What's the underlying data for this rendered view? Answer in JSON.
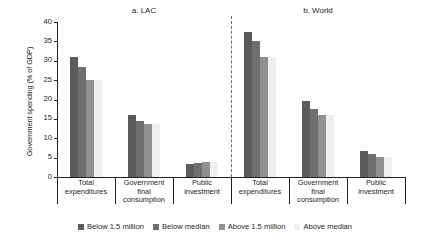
{
  "chart_data": {
    "type": "bar",
    "title": "",
    "xlabel": "",
    "ylabel": "Government spending (% of GDP)",
    "ylim": [
      0,
      40
    ],
    "yticks": [
      0,
      5,
      10,
      15,
      20,
      25,
      30,
      35,
      40
    ],
    "ytick_labels": [
      "0",
      "5",
      "10",
      "15",
      "20",
      "25",
      "30",
      "35",
      "40"
    ],
    "grid": false,
    "legend_position": "bottom",
    "panels": [
      {
        "title": "a. LAC",
        "categories": [
          "Total expenditures",
          "Government final consumption",
          "Public investment"
        ],
        "series": [
          {
            "name": "Below 1.5 million",
            "values": [
              31.0,
              16.0,
              3.3
            ]
          },
          {
            "name": "Below median",
            "values": [
              28.5,
              14.5,
              3.5
            ]
          },
          {
            "name": "Above 1.5 million",
            "values": [
              25.0,
              13.7,
              3.8
            ]
          },
          {
            "name": "Above median",
            "values": [
              25.0,
              13.7,
              3.8
            ]
          }
        ]
      },
      {
        "title": "b. World",
        "categories": [
          "Total expenditures",
          "Government final consumption",
          "Public investment"
        ],
        "series": [
          {
            "name": "Below 1.5 million",
            "values": [
              37.5,
              19.5,
              6.6
            ]
          },
          {
            "name": "Below median",
            "values": [
              35.0,
              17.6,
              6.0
            ]
          },
          {
            "name": "Above 1.5 million",
            "values": [
              31.0,
              16.0,
              5.2
            ]
          },
          {
            "name": "Above median",
            "values": [
              31.0,
              16.0,
              5.2
            ]
          }
        ]
      }
    ],
    "series_colors": [
      "#5b5b5d",
      "#6e6f71",
      "#8e9091",
      "#efefef"
    ],
    "legend": [
      {
        "label": "Below 1.5 million",
        "color": "#5b5b5d"
      },
      {
        "label": "Below median",
        "color": "#6e6f71"
      },
      {
        "label": "Above 1.5 million",
        "color": "#8e9091"
      },
      {
        "label": "Above median",
        "color": "#efefef"
      }
    ]
  }
}
